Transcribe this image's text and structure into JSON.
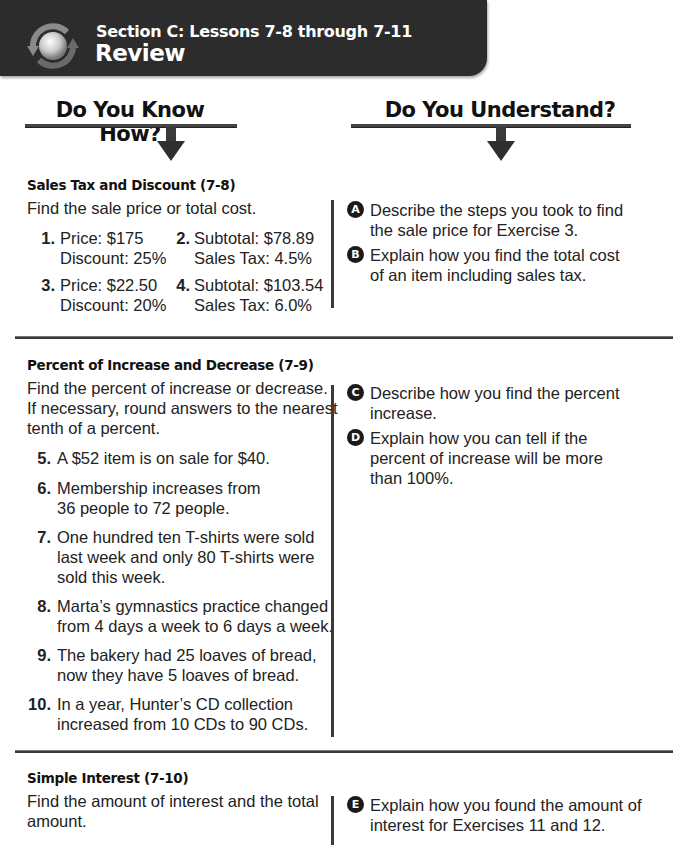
{
  "banner": {
    "icon": "review-cycle-icon",
    "subtitle": "Section C: Lessons 7-8 through 7-11",
    "title": "Review"
  },
  "columns": {
    "left_heading": "Do You Know How?",
    "right_heading": "Do You Understand?",
    "arrow_icon": "down-arrow-icon"
  },
  "sections": [
    {
      "title": "Sales Tax and Discount (7-8)",
      "instructions": [
        "Find the sale price or total cost."
      ],
      "exercises": [
        {
          "num": "1.",
          "lines": [
            "Price: $175",
            "Discount: 25%"
          ]
        },
        {
          "num": "2.",
          "lines": [
            "Subtotal: $78.89",
            "Sales Tax: 4.5%"
          ]
        },
        {
          "num": "3.",
          "lines": [
            "Price: $22.50",
            "Discount: 20%"
          ]
        },
        {
          "num": "4.",
          "lines": [
            "Subtotal: $103.54",
            "Sales Tax: 6.0%"
          ]
        }
      ],
      "questions": [
        {
          "letter": "A",
          "lines": [
            "Describe the steps you took to find",
            "the sale price for Exercise 3."
          ]
        },
        {
          "letter": "B",
          "lines": [
            "Explain how you find the total cost",
            "of an item including sales tax."
          ]
        }
      ]
    },
    {
      "title": "Percent of Increase and Decrease (7-9)",
      "instructions": [
        "Find the percent of increase or decrease.",
        "If necessary, round answers to the nearest",
        "tenth of a percent."
      ],
      "exercises": [
        {
          "num": "5.",
          "lines": [
            "A $52 item is on sale for $40."
          ]
        },
        {
          "num": "6.",
          "lines": [
            "Membership increases from",
            "36 people to 72 people."
          ]
        },
        {
          "num": "7.",
          "lines": [
            "One hundred ten T-shirts were sold",
            "last week and only 80 T-shirts were",
            "sold this week."
          ]
        },
        {
          "num": "8.",
          "lines": [
            "Marta’s gymnastics practice changed",
            "from 4 days a week to 6 days a week."
          ]
        },
        {
          "num": "9.",
          "lines": [
            "The bakery had 25 loaves of bread,",
            "now they have 5 loaves of bread."
          ]
        },
        {
          "num": "10.",
          "lines": [
            "In a year, Hunter’s CD collection",
            "increased from 10 CDs to 90 CDs."
          ]
        }
      ],
      "questions": [
        {
          "letter": "C",
          "lines": [
            "Describe how you find the percent",
            "increase."
          ]
        },
        {
          "letter": "D",
          "lines": [
            "Explain how you can tell if the",
            "percent of increase will be more",
            "than 100%."
          ]
        }
      ]
    },
    {
      "title": "Simple Interest (7-10)",
      "instructions": [
        "Find the amount of interest and the total",
        "amount."
      ],
      "exercises": [],
      "questions": [
        {
          "letter": "E",
          "lines": [
            "Explain how you found the amount of",
            "interest for Exercises 11 and 12."
          ]
        }
      ]
    }
  ]
}
